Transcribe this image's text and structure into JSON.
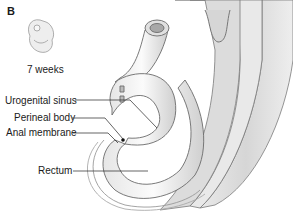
{
  "figure": {
    "panel_letter": "B",
    "embryo_age": "7 weeks"
  },
  "labels": [
    {
      "text": "Urogenital sinus"
    },
    {
      "text": "Perineal body"
    },
    {
      "text": "Anal membrane"
    },
    {
      "text": "Rectum"
    }
  ],
  "colors": {
    "outline": "#6b6b6b",
    "fill_light": "#f2f2f2",
    "fill_mid": "#d9d9d9",
    "fill_dark": "#bdbdbd",
    "leader": "#222222"
  }
}
